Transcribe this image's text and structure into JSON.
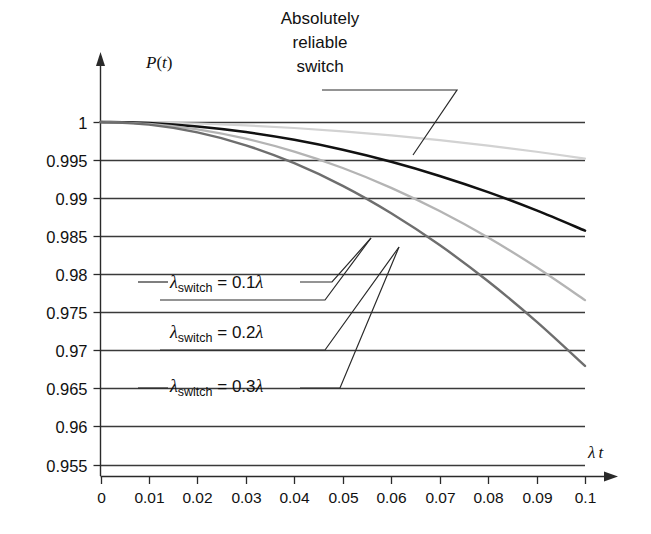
{
  "chart_data": {
    "type": "line",
    "title": "",
    "xlabel": "λ t",
    "ylabel": "P(t)",
    "xlim": [
      0,
      0.1
    ],
    "ylim": [
      0.955,
      1.0
    ],
    "grid": true,
    "legend_position": "inline-annotations",
    "x_ticks": [
      "0",
      "0.01",
      "0.02",
      "0.03",
      "0.04",
      "0.05",
      "0.06",
      "0.07",
      "0.08",
      "0.09",
      "0.1"
    ],
    "x_tick_values": [
      0,
      0.01,
      0.02,
      0.03,
      0.04,
      0.05,
      0.06,
      0.07,
      0.08,
      0.09,
      0.1
    ],
    "y_ticks": [
      "1",
      "0.995",
      "0.99",
      "0.985",
      "0.98",
      "0.975",
      "0.97",
      "0.965",
      "0.96",
      "0.955"
    ],
    "y_tick_values": [
      1,
      0.995,
      0.99,
      0.985,
      0.98,
      0.975,
      0.97,
      0.965,
      0.96,
      0.955
    ],
    "x": [
      0,
      0.01,
      0.02,
      0.03,
      0.04,
      0.05,
      0.06,
      0.07,
      0.08,
      0.09,
      0.1
    ],
    "series": [
      {
        "name": "Absolutely reliable switch",
        "color": "#d2d2d2",
        "width": 2.2,
        "values": [
          1.0,
          0.99995,
          0.9998,
          0.99955,
          0.99921,
          0.99877,
          0.99824,
          0.99762,
          0.9969,
          0.99609,
          0.99519
        ]
      },
      {
        "name": "λswitch = 0.1λ",
        "color": "#111111",
        "width": 2.6,
        "values": [
          1.0,
          0.99985,
          0.99941,
          0.99868,
          0.99766,
          0.99636,
          0.99478,
          0.99292,
          0.99079,
          0.98839,
          0.98573
        ]
      },
      {
        "name": "λswitch = 0.2λ",
        "color": "#b4b4b4",
        "width": 2.3,
        "values": [
          1.0,
          0.99975,
          0.99902,
          0.9978,
          0.99611,
          0.99396,
          0.99135,
          0.9883,
          0.98482,
          0.98091,
          0.9766
        ]
      },
      {
        "name": "λswitch = 0.3λ",
        "color": "#6e6e6e",
        "width": 2.4,
        "values": [
          1.0,
          0.99965,
          0.99863,
          0.99694,
          0.99459,
          0.99161,
          0.98801,
          0.98383,
          0.97907,
          0.97377,
          0.96795
        ]
      }
    ],
    "annotations": [
      {
        "id": "absolutely-reliable-switch",
        "lines": [
          "Absolutely",
          "reliable",
          "switch"
        ],
        "text": "Absolutely reliable switch"
      },
      {
        "id": "lambda-switch-01",
        "prefix": "λ",
        "sub": "switch",
        "equals": " = 0.1",
        "suffix": "λ",
        "text": "λswitch = 0.1λ"
      },
      {
        "id": "lambda-switch-02",
        "prefix": "λ",
        "sub": "switch",
        "equals": " = 0.2",
        "suffix": "λ",
        "text": "λswitch = 0.2λ"
      },
      {
        "id": "lambda-switch-03",
        "prefix": "λ",
        "sub": "switch",
        "equals": " = 0.3",
        "suffix": "λ",
        "text": "λswitch = 0.3λ"
      }
    ]
  },
  "axes": {
    "y_axis_title": "P(t)",
    "y_axis_title_p": "P",
    "y_axis_title_paren_open": "(",
    "y_axis_title_t": "t",
    "y_axis_title_paren_close": ")",
    "x_axis_title_lambda": "λ",
    "x_axis_title_t": "t"
  },
  "ticks": {
    "y": [
      {
        "label": "1",
        "value": 1
      },
      {
        "label": "0.995",
        "value": 0.995
      },
      {
        "label": "0.99",
        "value": 0.99
      },
      {
        "label": "0.985",
        "value": 0.985
      },
      {
        "label": "0.98",
        "value": 0.98
      },
      {
        "label": "0.975",
        "value": 0.975
      },
      {
        "label": "0.97",
        "value": 0.97
      },
      {
        "label": "0.965",
        "value": 0.965
      },
      {
        "label": "0.96",
        "value": 0.96
      },
      {
        "label": "0.955",
        "value": 0.955
      }
    ],
    "x": [
      {
        "label": "0",
        "value": 0
      },
      {
        "label": "0.01",
        "value": 0.01
      },
      {
        "label": "0.02",
        "value": 0.02
      },
      {
        "label": "0.03",
        "value": 0.03
      },
      {
        "label": "0.04",
        "value": 0.04
      },
      {
        "label": "0.05",
        "value": 0.05
      },
      {
        "label": "0.06",
        "value": 0.06
      },
      {
        "label": "0.07",
        "value": 0.07
      },
      {
        "label": "0.08",
        "value": 0.08
      },
      {
        "label": "0.09",
        "value": 0.09
      },
      {
        "label": "0.1",
        "value": 0.1
      }
    ]
  },
  "colors": {
    "background": "#ffffff",
    "grid": "#3a3a3a",
    "axis": "#2a2a2a",
    "text": "#111111",
    "curve_reliable": "#d2d2d2",
    "curve_01": "#111111",
    "curve_02": "#b4b4b4",
    "curve_03": "#6e6e6e"
  }
}
